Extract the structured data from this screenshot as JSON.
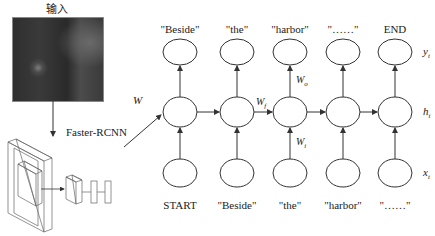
{
  "input": {
    "title": "输入",
    "image_description": "aerial grayscale photo"
  },
  "detector": {
    "label": "Faster-RCNN"
  },
  "weights": {
    "w": "W",
    "wf": "W_f",
    "wo": "W_o",
    "wi": "W_i"
  },
  "rows": {
    "y": "y_t",
    "h": "h_t",
    "x": "x_t"
  },
  "outputs": [
    "\"Beside\"",
    "\"the\"",
    "\"harbor\"",
    "\"……\"",
    "END"
  ],
  "inputs": [
    "START",
    "\"Beside\"",
    "\"the\"",
    "\"harbor\"",
    "\"……\""
  ],
  "colors": {
    "line": "#333333",
    "background": "#ffffff"
  }
}
